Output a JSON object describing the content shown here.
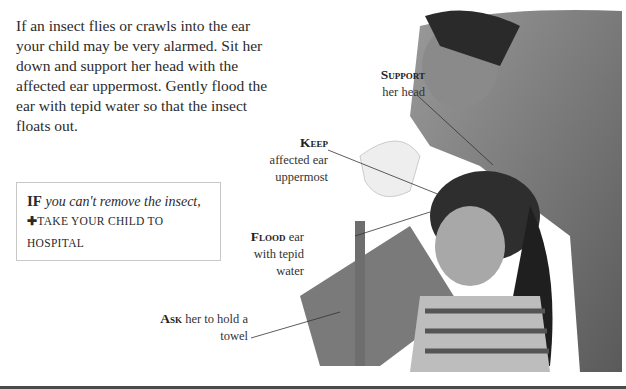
{
  "intro_text": "If an insect flies or crawls into the ear your child may be very alarmed. Sit her down and support her head with the affected ear uppermost. Gently flood the ear with tepid water so that the insect floats out.",
  "warning_box": {
    "lead": "IF",
    "condition": "you can't remove the insect,",
    "action_icon": "cross-icon",
    "action_symbol": "✚",
    "action": "TAKE YOUR CHILD TO HOSPITAL"
  },
  "callouts": [
    {
      "key": "Support",
      "text": "her head"
    },
    {
      "key": "Keep",
      "text": "affected ear uppermost"
    },
    {
      "key": "Flood",
      "text": "ear with tepid water"
    },
    {
      "key": "Ask",
      "text": "her to hold a towel"
    }
  ]
}
